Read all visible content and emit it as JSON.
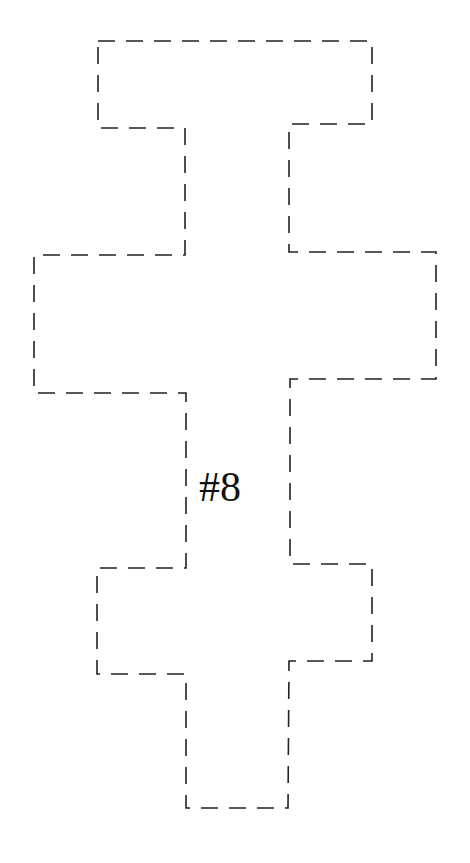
{
  "figure": {
    "label": "#8",
    "label_position": {
      "x": 199,
      "y": 466
    },
    "shape": {
      "style": "dashed outline",
      "stroke_color": "#222222",
      "points": [
        [
          98,
          41
        ],
        [
          372,
          41
        ],
        [
          372,
          124
        ],
        [
          289,
          124
        ],
        [
          289,
          252
        ],
        [
          436,
          252
        ],
        [
          436,
          379
        ],
        [
          290,
          379
        ],
        [
          290,
          564
        ],
        [
          372,
          564
        ],
        [
          372,
          661
        ],
        [
          289,
          661
        ],
        [
          288,
          808
        ],
        [
          186,
          808
        ],
        [
          186,
          674
        ],
        [
          97,
          674
        ],
        [
          97,
          568
        ],
        [
          186,
          568
        ],
        [
          186,
          393
        ],
        [
          34,
          393
        ],
        [
          34,
          255
        ],
        [
          185,
          255
        ],
        [
          185,
          128
        ],
        [
          98,
          128
        ]
      ]
    }
  }
}
